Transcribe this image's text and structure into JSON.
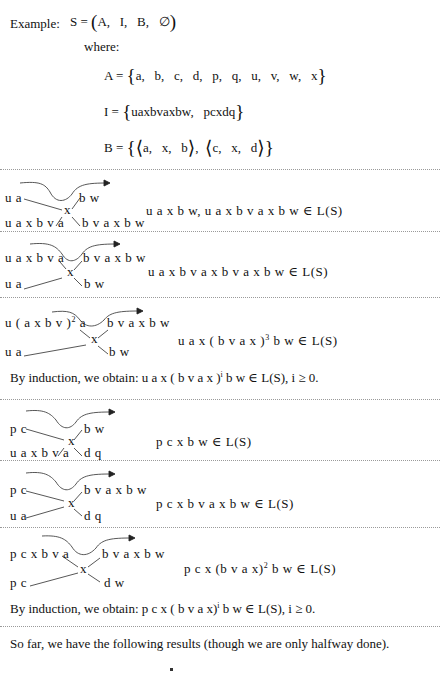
{
  "header": {
    "example_label": "Example:",
    "system_lhs": "S =",
    "system_tuple": "A,   I,   B,   ∅",
    "where_label": "where:"
  },
  "definitions": {
    "alphabet": {
      "lhs": "A =",
      "items": "a,   b,   c,   d,   p,   q,   u,   v,   w,   x"
    },
    "initial": {
      "lhs": "I =",
      "items": "uaxbvaxbw,   pcxdq"
    },
    "rules": {
      "lhs": "B =",
      "rule1": "a,   x,   b",
      "rule2": "c,   x,   d"
    }
  },
  "steps": [
    {
      "top_left": "u a",
      "bottom_left": "u a x b v a",
      "center": "x",
      "top_right": "b w",
      "bottom_right": "b v a x b w",
      "result": "u a x b w,  u a x b v a x b w  ∈ L(S)"
    },
    {
      "top_left": "u a x b v a",
      "bottom_left": "u a",
      "center": "x",
      "top_right": "b v a x b w",
      "bottom_right": "b w",
      "result": "u a x b v a x b v a x b w  ∈ L(S)"
    },
    {
      "top_left_pre": "u ( a x b v )",
      "top_left_sup": "2",
      "top_left_post": " a",
      "bottom_left": "u a",
      "center": "x",
      "top_right": "b v a x b w",
      "bottom_right": "b w",
      "result_pre": "u a x ( b v a x )",
      "result_sup": "3",
      "result_post": " b w  ∈ L(S)"
    },
    {
      "top_left": "p c",
      "bottom_left": "u a x b v a",
      "center": "x",
      "top_right": "b w",
      "bottom_right": "d q",
      "result": "p c x b w  ∈ L(S)"
    },
    {
      "top_left": "p c",
      "bottom_left": "u a",
      "center": "x",
      "top_right": "b v a x b w",
      "bottom_right": "d q",
      "result": "p c x b v a x b w  ∈ L(S)"
    },
    {
      "top_left": "p c x b v a",
      "bottom_left": "p c",
      "center": "x",
      "top_right": "b v a x b w",
      "bottom_right": "d w",
      "result_pre": "p c x (b v a x)",
      "result_sup": "2",
      "result_post": " b w  ∈ L(S)"
    }
  ],
  "inductions": [
    {
      "pre": "By induction, we obtain: u a x ( b v a x )",
      "sup": "i",
      "post": " b w  ∈ L(S), i ≥ 0."
    },
    {
      "pre": "By induction, we obtain: p c x ( b v a x)",
      "sup": "i",
      "post": " b w  ∈ L(S), i ≥ 0."
    }
  ],
  "footer": {
    "summary": "So far, we have the following results (though we are only halfway done)."
  }
}
